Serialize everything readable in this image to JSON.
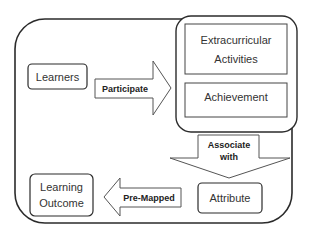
{
  "diagram": {
    "nodes": {
      "learners": "Learners",
      "extracurricular_line1": "Extracurricular",
      "extracurricular_line2": "Activities",
      "achievement": "Achievement",
      "attribute": "Attribute",
      "learning_outcome_line1": "Learning",
      "learning_outcome_line2": "Outcome"
    },
    "arrows": {
      "participate": "Participate",
      "associate_line1": "Associate",
      "associate_line2": "with",
      "premapped": "Pre-Mapped"
    },
    "colors": {
      "stroke": "#2b2b2b",
      "fill": "#ffffff",
      "text": "#333333"
    }
  }
}
